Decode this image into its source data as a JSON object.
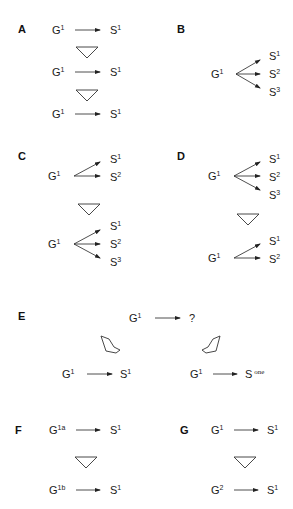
{
  "figure": {
    "panels": {
      "A": {
        "label": "A",
        "rows": [
          {
            "gene": "G",
            "gene_sup": "1",
            "state": "S",
            "state_sup": "1"
          },
          {
            "gene": "G",
            "gene_sup": "1",
            "state": "S",
            "state_sup": "1"
          },
          {
            "gene": "G",
            "gene_sup": "1",
            "state": "S",
            "state_sup": "1"
          }
        ]
      },
      "B": {
        "label": "B",
        "gene": "G",
        "gene_sup": "1",
        "states": [
          {
            "name": "S",
            "sup": "1"
          },
          {
            "name": "S",
            "sup": "2"
          },
          {
            "name": "S",
            "sup": "3"
          }
        ]
      },
      "C": {
        "label": "C",
        "top": {
          "gene": "G",
          "gene_sup": "1",
          "states": [
            {
              "name": "S",
              "sup": "1"
            },
            {
              "name": "S",
              "sup": "2"
            }
          ]
        },
        "bottom": {
          "gene": "G",
          "gene_sup": "1",
          "states": [
            {
              "name": "S",
              "sup": "1"
            },
            {
              "name": "S",
              "sup": "2"
            },
            {
              "name": "S",
              "sup": "3"
            }
          ]
        }
      },
      "D": {
        "label": "D",
        "top": {
          "gene": "G",
          "gene_sup": "1",
          "states": [
            {
              "name": "S",
              "sup": "1"
            },
            {
              "name": "S",
              "sup": "2"
            },
            {
              "name": "S",
              "sup": "3"
            }
          ]
        },
        "bottom": {
          "gene": "G",
          "gene_sup": "1",
          "states": [
            {
              "name": "S",
              "sup": "1"
            },
            {
              "name": "S",
              "sup": "2"
            }
          ]
        }
      },
      "E": {
        "label": "E",
        "top": {
          "gene": "G",
          "gene_sup": "1",
          "state": "?"
        },
        "left": {
          "gene": "G",
          "gene_sup": "1",
          "state": "S",
          "state_sup": "1"
        },
        "right": {
          "gene": "G",
          "gene_sup": "1",
          "state": "S",
          "state_sup": "one"
        }
      },
      "F": {
        "label": "F",
        "top": {
          "gene": "G",
          "gene_sup": "1a",
          "state": "S",
          "state_sup": "1"
        },
        "bottom": {
          "gene": "G",
          "gene_sup": "1b",
          "state": "S",
          "state_sup": "1"
        }
      },
      "G": {
        "label": "G",
        "top": {
          "gene": "G",
          "gene_sup": "1",
          "state": "S",
          "state_sup": "1"
        },
        "bottom": {
          "gene": "G",
          "gene_sup": "2",
          "state": "S",
          "state_sup": "1"
        }
      }
    },
    "icons": {
      "small_arrow": "arrow-right-icon",
      "transition": "hollow-arrow-down-icon"
    }
  }
}
